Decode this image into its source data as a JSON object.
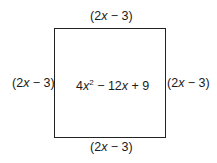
{
  "diagram": {
    "type": "square",
    "sides": {
      "top": "(2x − 3)",
      "bottom": "(2x − 3)",
      "left": "(2x − 3)",
      "right": "(2x − 3)"
    },
    "area_expression": "4x² − 12x + 9",
    "parts": {
      "open": "(2",
      "var": "x",
      "rest": " − 3)",
      "area_coef": "4",
      "area_exp": "2",
      "area_mid": " − 12",
      "area_end": " + 9"
    }
  }
}
